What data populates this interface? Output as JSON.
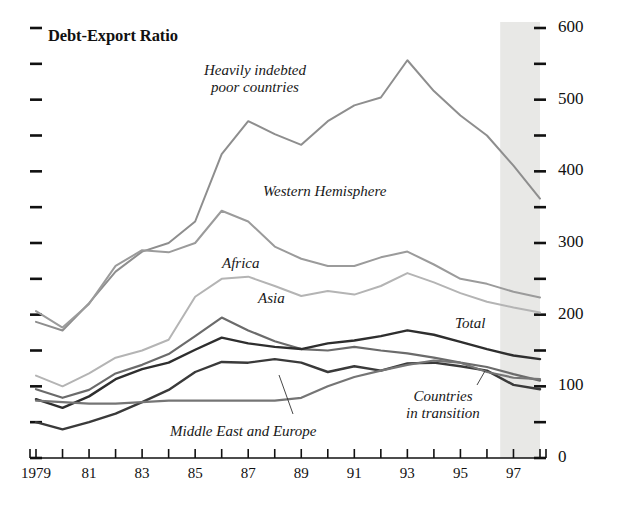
{
  "chart_data": {
    "type": "line",
    "title": "Debt-Export Ratio",
    "xlabel": "",
    "ylabel": "",
    "xlim": [
      1979,
      1998
    ],
    "ylim": [
      0,
      600
    ],
    "grid": false,
    "legend_position": "inline-annotations",
    "y_ticks_major": [
      0,
      100,
      200,
      300,
      400,
      500,
      600
    ],
    "y_ticks_minor": [
      50,
      150,
      250,
      350,
      450,
      550
    ],
    "y_tick_labels": [
      "0",
      "100",
      "200",
      "300",
      "400",
      "500",
      "600"
    ],
    "x_ticks": [
      1979,
      1980,
      1981,
      1982,
      1983,
      1984,
      1985,
      1986,
      1987,
      1988,
      1989,
      1990,
      1991,
      1992,
      1993,
      1994,
      1995,
      1996,
      1997,
      1998
    ],
    "x_tick_labels": [
      "1979",
      "",
      "81",
      "",
      "83",
      "",
      "85",
      "",
      "87",
      "",
      "89",
      "",
      "91",
      "",
      "93",
      "",
      "95",
      "",
      "97",
      ""
    ],
    "shaded_forecast_region": [
      1996.5,
      1998
    ],
    "shaded_region_color": "#e8e8e6",
    "x": [
      1979,
      1980,
      1981,
      1982,
      1983,
      1984,
      1985,
      1986,
      1987,
      1988,
      1989,
      1990,
      1991,
      1992,
      1993,
      1994,
      1995,
      1996,
      1997,
      1998
    ],
    "series": [
      {
        "name": "Heavily indebted poor countries",
        "color": "#8e8e8e",
        "width": 2.0,
        "dash": "none",
        "values": [
          190,
          178,
          216,
          260,
          288,
          300,
          330,
          424,
          470,
          452,
          437,
          470,
          492,
          503,
          555,
          512,
          478,
          450,
          408,
          362
        ]
      },
      {
        "name": "Western Hemisphere",
        "color": "#9b9b9b",
        "width": 2.0,
        "dash": "none",
        "values": [
          205,
          182,
          215,
          268,
          290,
          287,
          300,
          345,
          330,
          295,
          278,
          268,
          268,
          280,
          288,
          270,
          250,
          243,
          232,
          224
        ]
      },
      {
        "name": "Africa",
        "color": "#b4b4b4",
        "width": 2.0,
        "dash": "none",
        "values": [
          115,
          100,
          118,
          140,
          150,
          165,
          225,
          250,
          253,
          240,
          226,
          233,
          228,
          240,
          258,
          245,
          230,
          218,
          210,
          203
        ]
      },
      {
        "name": "Asia",
        "color": "#6b6b6b",
        "width": 2.2,
        "dash": "none",
        "values": [
          96,
          84,
          95,
          118,
          130,
          145,
          170,
          196,
          178,
          163,
          152,
          150,
          155,
          150,
          146,
          140,
          133,
          127,
          117,
          108
        ]
      },
      {
        "name": "Total",
        "color": "#2e2e2e",
        "width": 2.4,
        "dash": "none",
        "values": [
          82,
          70,
          86,
          110,
          124,
          133,
          151,
          168,
          160,
          155,
          152,
          160,
          164,
          170,
          178,
          172,
          162,
          152,
          143,
          138
        ]
      },
      {
        "name": "Middle East and Europe",
        "color": "#3a3a3a",
        "width": 2.4,
        "dash": "none",
        "values": [
          50,
          40,
          50,
          62,
          78,
          95,
          120,
          134,
          133,
          138,
          133,
          120,
          128,
          122,
          132,
          133,
          128,
          122,
          102,
          96
        ]
      },
      {
        "name": "Countries in transition",
        "color": "#757575",
        "width": 2.2,
        "dash": "none",
        "values": [
          80,
          78,
          76,
          76,
          78,
          80,
          80,
          80,
          80,
          80,
          84,
          100,
          113,
          122,
          130,
          136,
          133,
          120,
          112,
          110
        ]
      }
    ],
    "annotations": [
      {
        "id": "hipc",
        "text_lines": [
          "Heavily indebted",
          "poor countries"
        ],
        "x_px": 255,
        "y_px": 62,
        "align": "center",
        "leader": false
      },
      {
        "id": "western-hemisphere",
        "text_lines": [
          "Western Hemisphere"
        ],
        "x_px": 263,
        "y_px": 183,
        "align": "left",
        "leader": false
      },
      {
        "id": "africa",
        "text_lines": [
          "Africa"
        ],
        "x_px": 222,
        "y_px": 255,
        "align": "left",
        "leader": false
      },
      {
        "id": "asia",
        "text_lines": [
          "Asia"
        ],
        "x_px": 258,
        "y_px": 290,
        "align": "left",
        "leader": false
      },
      {
        "id": "total",
        "text_lines": [
          "Total"
        ],
        "x_px": 455,
        "y_px": 315,
        "align": "left",
        "leader": false
      },
      {
        "id": "middle-east-and-europe",
        "text_lines": [
          "Middle East and Europe"
        ],
        "x_px": 170,
        "y_px": 423,
        "align": "left",
        "leader": true,
        "leader_from": [
          293,
          414
        ],
        "leader_to": [
          279,
          375
        ]
      },
      {
        "id": "countries-in-transition",
        "text_lines": [
          "Countries",
          "in transition"
        ],
        "x_px": 443,
        "y_px": 388,
        "align": "center",
        "leader": true,
        "leader_from": [
          477,
          385
        ],
        "leader_to": [
          485,
          371
        ]
      }
    ]
  },
  "axes": {
    "left_axis_ticks_count": 13,
    "right_axis_labels": [
      "600",
      "500",
      "400",
      "300",
      "200",
      "100",
      "0"
    ]
  }
}
